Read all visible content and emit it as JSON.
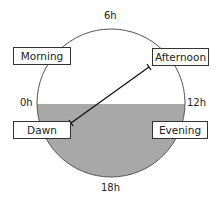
{
  "ticks": {
    "top": "6h",
    "left": "0h",
    "right": "12h",
    "bottom": "18h"
  },
  "boxes": {
    "morning": "Morning",
    "afternoon": "Afternoon",
    "dawn": "Dawn",
    "evening": "Evening"
  },
  "colors": {
    "fill": "#a8a8a8",
    "stroke": "#444444"
  }
}
